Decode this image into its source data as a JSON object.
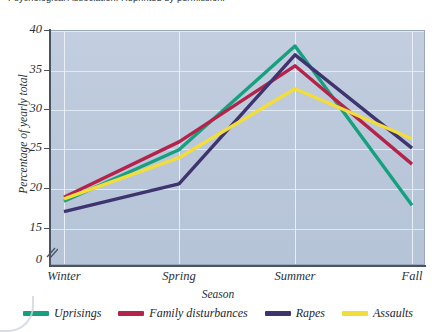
{
  "caption": {
    "line1": "Psychological Association. Reprinted by permission."
  },
  "chart_data": {
    "type": "line",
    "title": "",
    "xlabel": "Season",
    "ylabel": "Percentage of yearly total",
    "categories": [
      "Winter",
      "Spring",
      "Summer",
      "Fall"
    ],
    "ylim": [
      15,
      40
    ],
    "yticks": [
      15,
      20,
      25,
      30,
      35,
      40
    ],
    "ytick_labels": [
      "15",
      "20",
      "25",
      "30",
      "35",
      "40"
    ],
    "axis_origin_label": "0",
    "axis_break": true,
    "grid": true,
    "legend_position": "bottom",
    "series": [
      {
        "name": "Uprisings",
        "color": "#17a07e",
        "values": [
          18.5,
          25.0,
          38.1,
          18.0
        ]
      },
      {
        "name": "Family disturbances",
        "color": "#b4244a",
        "values": [
          19.0,
          26.0,
          35.6,
          23.2
        ]
      },
      {
        "name": "Rapes",
        "color": "#3e3470",
        "values": [
          17.2,
          20.7,
          37.0,
          25.2
        ]
      },
      {
        "name": "Assaults",
        "color": "#f2dd3a",
        "values": [
          18.8,
          24.0,
          32.7,
          26.4
        ]
      }
    ]
  },
  "colors": {
    "plot_background": "#bfcbdd",
    "gridline": "#e8eef6",
    "axis": "#4b5360",
    "text": "#2b3038"
  }
}
